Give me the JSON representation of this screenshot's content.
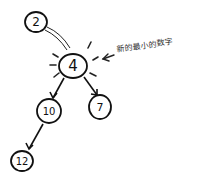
{
  "diagram": {
    "type": "tree",
    "style": "hand-drawn",
    "nodes": [
      {
        "id": "n2",
        "label": "2",
        "x": 36,
        "y": 22,
        "r": 11
      },
      {
        "id": "n4",
        "label": "4",
        "x": 73,
        "y": 66,
        "r": 14
      },
      {
        "id": "n10",
        "label": "10",
        "x": 49,
        "y": 111,
        "r": 12
      },
      {
        "id": "n7",
        "label": "7",
        "x": 100,
        "y": 107,
        "r": 11
      },
      {
        "id": "n12",
        "label": "12",
        "x": 22,
        "y": 161,
        "r": 11
      }
    ],
    "edges": [
      {
        "from": "n2",
        "to": "n4",
        "style": "double-line"
      },
      {
        "from": "n4",
        "to": "n10",
        "style": "arrow"
      },
      {
        "from": "n4",
        "to": "n7",
        "style": "arrow"
      },
      {
        "from": "n10",
        "to": "n12",
        "style": "arrow"
      }
    ],
    "highlighted_node": "n4",
    "annotation": {
      "text": "新的最小的数字",
      "points_to": "n4"
    }
  }
}
